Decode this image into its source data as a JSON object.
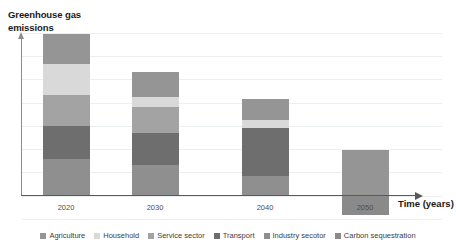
{
  "chart_data": {
    "type": "bar",
    "variant": "stacked",
    "title": "",
    "ylabel": "Greenhouse gas emissions",
    "xlabel": "Time (years)",
    "categories": [
      "2020",
      "2030",
      "2040",
      "2050"
    ],
    "grid": true,
    "gridlines": 8,
    "legend_position": "bottom",
    "ylim": [
      -22,
      142
    ],
    "yaxis_ticks_shown": false,
    "series": [
      {
        "name": "Agriculture",
        "color": "#959595",
        "values": [
          26,
          22,
          18,
          40
        ]
      },
      {
        "name": "Household",
        "color": "#d9d9d9",
        "values": [
          27,
          9,
          7,
          0
        ]
      },
      {
        "name": "Service sector",
        "color": "#a3a3a3",
        "values": [
          27,
          22,
          0,
          0
        ]
      },
      {
        "name": "Transport",
        "color": "#6e6e6e",
        "values": [
          29,
          28,
          42,
          0
        ]
      },
      {
        "name": "Industry secotor",
        "color": "#8f8f8f",
        "values": [
          32,
          27,
          17,
          0
        ]
      },
      {
        "name": "Carbon sequestration",
        "color": "#8a8a8a",
        "values": [
          0,
          0,
          0,
          -17
        ]
      }
    ]
  },
  "axes": {
    "y_title_line1": "Greenhouse gas",
    "y_title_line2": "emissions",
    "x_title": "Time (years)"
  },
  "ticks": {
    "t0": "2020",
    "t1": "2030",
    "t2": "2040",
    "t3": "2050"
  },
  "legend": {
    "items": [
      {
        "label": "Agriculture"
      },
      {
        "label": "Household"
      },
      {
        "label": "Service sector"
      },
      {
        "label": "Transport"
      },
      {
        "label": "Industry secotor"
      },
      {
        "label": "Carbon sequestration"
      }
    ]
  }
}
